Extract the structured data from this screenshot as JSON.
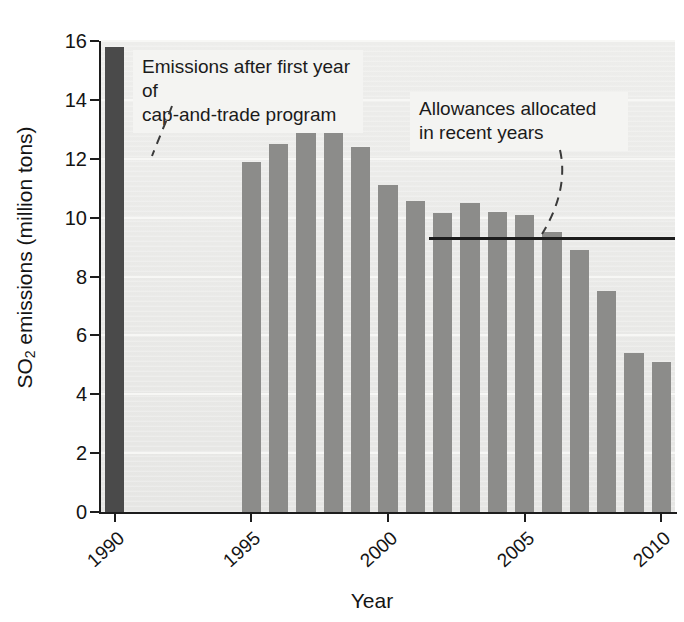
{
  "chart_data": {
    "type": "bar",
    "title": "",
    "xlabel": "Year",
    "ylabel": "SO2 emissions (million tons)",
    "ylabel_display": "SO₂ emissions (million tons)",
    "ylim": [
      0,
      16
    ],
    "ytick_values": [
      0,
      2,
      4,
      6,
      8,
      10,
      12,
      14,
      16
    ],
    "ytick_labels": [
      "0",
      "2",
      "4",
      "6",
      "8",
      "10",
      "12",
      "14",
      "16"
    ],
    "xtick_labels": [
      "1990",
      "1995",
      "2000",
      "2005",
      "2010"
    ],
    "grid": true,
    "legend": "none",
    "categories": [
      "1990",
      "1991",
      "1992",
      "1993",
      "1994",
      "1995",
      "1996",
      "1997",
      "1998",
      "1999",
      "2000",
      "2001",
      "2002",
      "2003",
      "2004",
      "2005",
      "2006",
      "2007",
      "2008",
      "2009",
      "2010"
    ],
    "values": [
      15.8,
      null,
      null,
      null,
      null,
      11.9,
      12.5,
      12.9,
      13.0,
      12.4,
      11.1,
      10.55,
      10.15,
      10.5,
      10.2,
      10.1,
      9.5,
      8.9,
      7.5,
      5.4,
      5.1
    ],
    "bars": [
      {
        "year": "1990",
        "value": 15.8,
        "style": "highlight"
      },
      {
        "year": "1995",
        "value": 11.9,
        "style": "normal"
      },
      {
        "year": "1996",
        "value": 12.5,
        "style": "normal"
      },
      {
        "year": "1997",
        "value": 12.9,
        "style": "normal"
      },
      {
        "year": "1998",
        "value": 13.0,
        "style": "normal"
      },
      {
        "year": "1999",
        "value": 12.4,
        "style": "normal"
      },
      {
        "year": "2000",
        "value": 11.1,
        "style": "normal"
      },
      {
        "year": "2001",
        "value": 10.55,
        "style": "normal"
      },
      {
        "year": "2002",
        "value": 10.15,
        "style": "normal"
      },
      {
        "year": "2003",
        "value": 10.5,
        "style": "normal"
      },
      {
        "year": "2004",
        "value": 10.2,
        "style": "normal"
      },
      {
        "year": "2005",
        "value": 10.1,
        "style": "normal"
      },
      {
        "year": "2006",
        "value": 9.5,
        "style": "normal"
      },
      {
        "year": "2007",
        "value": 8.9,
        "style": "normal"
      },
      {
        "year": "2008",
        "value": 7.5,
        "style": "normal"
      },
      {
        "year": "2009",
        "value": 5.4,
        "style": "normal"
      },
      {
        "year": "2010",
        "value": 5.1,
        "style": "normal"
      }
    ],
    "reference_line": {
      "label": "Allowances allocated in recent years",
      "value": 9.3,
      "start_year": "2002",
      "end_year": "2010"
    },
    "annotations": [
      {
        "id": "cap-and-trade-note",
        "text": "Emissions after first year of\ncap-and-trade program",
        "points_to": "1995"
      },
      {
        "id": "allowances-note",
        "text": "Allowances allocated\nin recent years",
        "points_to": "reference-line"
      }
    ],
    "colors": {
      "bar": "#8c8c8a",
      "bar_highlight": "#4a4a4a",
      "plot_background": "#e9e9e7",
      "gridline": "#f7f7f5",
      "axis": "#1d1d1d",
      "text": "#141414",
      "callout_background": "#f4f4f2"
    }
  }
}
